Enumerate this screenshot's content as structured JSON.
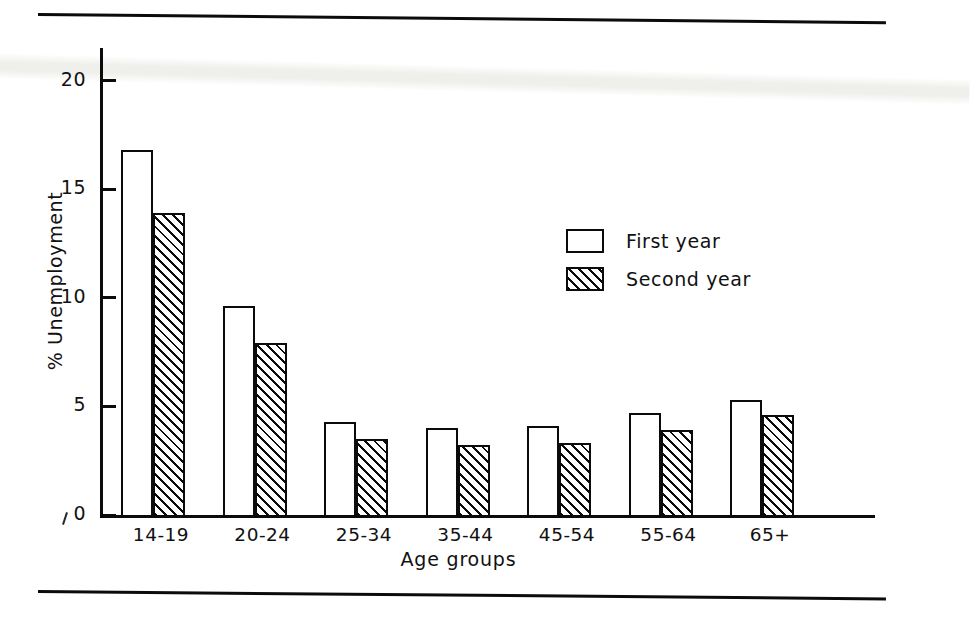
{
  "chart_data": {
    "type": "bar",
    "title": "",
    "xlabel": "Age groups",
    "ylabel": "% Unemployment",
    "categories": [
      "14-19",
      "20-24",
      "25-34",
      "35-44",
      "45-54",
      "55-64",
      "65+"
    ],
    "series": [
      {
        "name": "First year",
        "values": [
          16.8,
          9.6,
          4.3,
          4.0,
          4.1,
          4.7,
          5.3
        ]
      },
      {
        "name": "Second year",
        "values": [
          13.9,
          7.9,
          3.5,
          3.2,
          3.3,
          3.9,
          4.6
        ]
      }
    ],
    "ylim": [
      0,
      21.5
    ],
    "yticks": [
      0,
      5,
      10,
      15,
      20
    ],
    "ytick_labels": [
      "0",
      "5",
      "10",
      "15",
      "20"
    ],
    "grid": false,
    "legend_position": "center-right",
    "legend": [
      {
        "label": "First year",
        "pattern": "open"
      },
      {
        "label": "Second year",
        "pattern": "hatched"
      }
    ]
  },
  "figure": {
    "background_color": "#ffffff",
    "ink_color": "#0b0b0b",
    "top_rule": "horizontal-rule",
    "bottom_rule": "horizontal-rule"
  }
}
